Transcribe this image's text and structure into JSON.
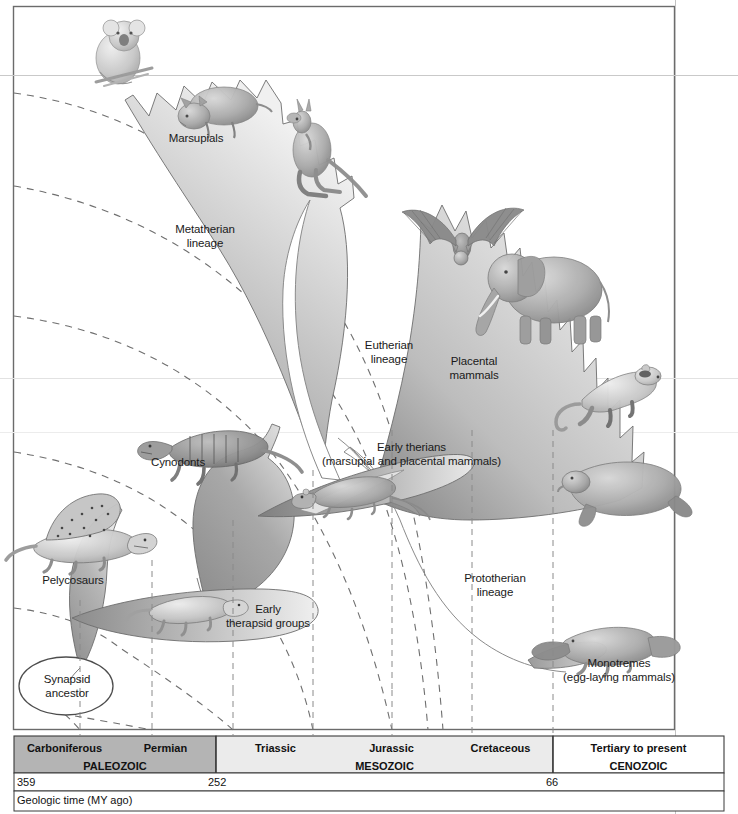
{
  "figure": {
    "caption": "Geologic time (MY ago)"
  },
  "clades": [
    {
      "id": "marsupials",
      "label": "Marsupials",
      "x": 196,
      "y": 140
    },
    {
      "id": "metatherian",
      "label": "Metatherian\nlineage",
      "x": 204,
      "y": 237
    },
    {
      "id": "eutherian",
      "label": "Eutherian\nlineage",
      "x": 389,
      "y": 352
    },
    {
      "id": "placental",
      "label": "Placental\nmammals",
      "x": 473,
      "y": 368
    },
    {
      "id": "cynodonts",
      "label": "Cynodonts",
      "x": 177,
      "y": 464
    },
    {
      "id": "pelycosaurs",
      "label": "Pelycosaurs",
      "x": 72,
      "y": 582
    },
    {
      "id": "early-therians",
      "label": "Early therians\n(marsupial and placental mammals)",
      "x": 411,
      "y": 456
    },
    {
      "id": "early-therapsid",
      "label": "Early\ntherapsid groups",
      "x": 267,
      "y": 612
    },
    {
      "id": "prototherian",
      "label": "Prototherian\nlineage",
      "x": 494,
      "y": 586
    },
    {
      "id": "monotremes",
      "label": "Monotremes\n(egg-laying mammals)",
      "x": 618,
      "y": 668
    },
    {
      "id": "synapsid-ancestor",
      "label": "Synapsid\nancestor",
      "x": 66,
      "y": 686
    }
  ],
  "animals": [
    {
      "id": "koala-illustration",
      "name": "koala"
    },
    {
      "id": "wombat-illustration",
      "name": "wombat"
    },
    {
      "id": "kangaroo-illustration",
      "name": "kangaroo"
    },
    {
      "id": "bat-illustration",
      "name": "bat"
    },
    {
      "id": "elephant-illustration",
      "name": "elephant"
    },
    {
      "id": "ferret-illustration",
      "name": "ferret"
    },
    {
      "id": "manatee-illustration",
      "name": "manatee"
    },
    {
      "id": "platypus-illustration",
      "name": "platypus"
    },
    {
      "id": "cynodont-illustration",
      "name": "cynodont"
    },
    {
      "id": "pelycosaur-illustration",
      "name": "pelycosaur (Dimetrodon)"
    },
    {
      "id": "therapsid-illustration",
      "name": "early therapsid"
    },
    {
      "id": "early-therian-illustration",
      "name": "early therian"
    }
  ],
  "timescale": {
    "caption": "Geologic time (MY ago)",
    "eras": [
      {
        "name": "PALEOZOIC",
        "color": "#b4b4b4",
        "start_px": 14,
        "end_px": 216
      },
      {
        "name": "MESOZOIC",
        "color": "#ebebeb",
        "start_px": 216,
        "end_px": 553
      },
      {
        "name": "CENOZOIC",
        "color": "#ffffff",
        "start_px": 553,
        "end_px": 724
      }
    ],
    "periods": [
      {
        "name": "Carboniferous",
        "start_px": 14,
        "end_px": 115
      },
      {
        "name": "Permian",
        "start_px": 115,
        "end_px": 216
      },
      {
        "name": "Triassic",
        "start_px": 216,
        "end_px": 335
      },
      {
        "name": "Jurassic",
        "start_px": 335,
        "end_px": 448
      },
      {
        "name": "Cretaceous",
        "start_px": 448,
        "end_px": 553
      },
      {
        "name": "Tertiary to present",
        "start_px": 553,
        "end_px": 724
      }
    ],
    "boundary_markers": [
      {
        "value": "359",
        "x_px": 16
      },
      {
        "value": "252",
        "x_px": 208
      },
      {
        "value": "66",
        "x_px": 548
      }
    ],
    "dashed_gridlines_px": [
      80,
      152,
      233,
      313,
      392,
      472,
      553
    ]
  }
}
